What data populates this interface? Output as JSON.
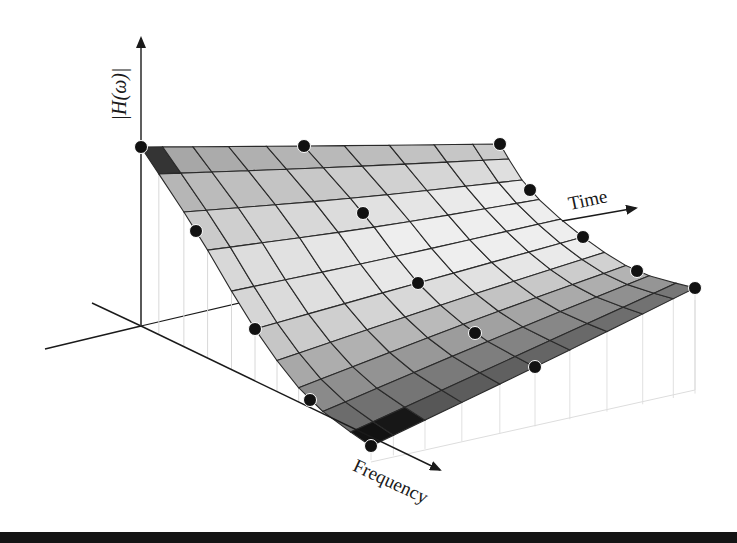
{
  "figure": {
    "type": "3d-surface-diagram",
    "axes": {
      "vertical_label": "|H(ω)|",
      "time_label": "Time",
      "frequency_label": "Frequency"
    },
    "control_grid": {
      "rows_along": "frequency",
      "cols_along": "time",
      "points": [
        [
          [
            141,
            147
          ],
          [
            304,
            146
          ],
          [
            500,
            144
          ]
        ],
        [
          [
            196,
            231
          ],
          [
            363,
            213
          ],
          [
            530,
            190
          ]
        ],
        [
          [
            255,
            329
          ],
          [
            418,
            283
          ],
          [
            583,
            237
          ]
        ],
        [
          [
            310,
            400
          ],
          [
            475,
            333
          ],
          [
            637,
            271
          ]
        ],
        [
          [
            371,
            446
          ],
          [
            535,
            367
          ],
          [
            695,
            288
          ]
        ]
      ]
    },
    "mesh": {
      "cells_u": 10,
      "cells_v": 10
    },
    "colors": {
      "dot": "#111111",
      "grid_line": "#2a2a2a",
      "axis": "#1a1a1a",
      "rule": "#141414"
    }
  }
}
